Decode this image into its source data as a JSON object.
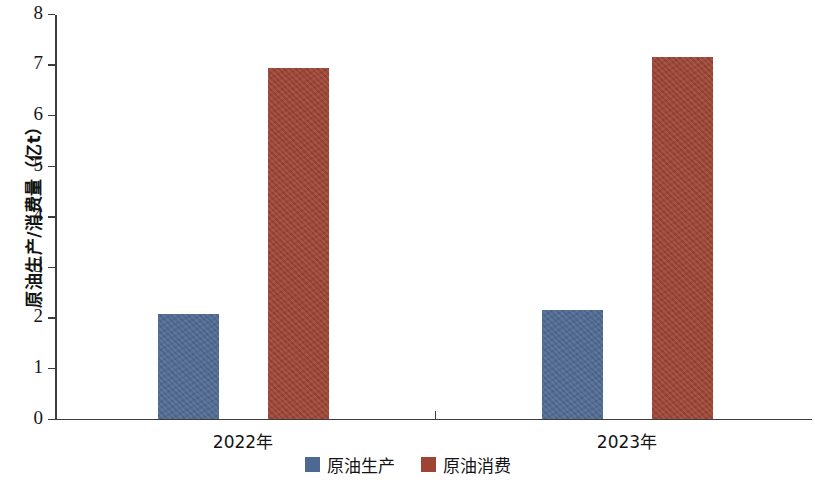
{
  "chart_data": {
    "type": "bar",
    "title": "",
    "xlabel": "",
    "ylabel": "原油生产/消费量（亿t）",
    "categories": [
      "2022年",
      "2023年"
    ],
    "series": [
      {
        "name": "原油生产",
        "color": "#4e6991",
        "values": [
          2.07,
          2.14
        ]
      },
      {
        "name": "原油消费",
        "color": "#9d4434",
        "values": [
          6.93,
          7.15
        ]
      }
    ],
    "ylim": [
      0,
      8
    ],
    "ytick_labels": [
      "0",
      "1",
      "2",
      "3",
      "4",
      "5",
      "6",
      "7",
      "8"
    ],
    "ytick_values": [
      0,
      1,
      2,
      3,
      4,
      5,
      6,
      7,
      8
    ],
    "grid": false,
    "legend_position": "bottom-center",
    "unit": "亿t"
  },
  "axis": {
    "y_title": "原油生产/消费量（亿t）",
    "ticks": [
      {
        "label": "8",
        "value": 8
      },
      {
        "label": "7",
        "value": 7
      },
      {
        "label": "6",
        "value": 6
      },
      {
        "label": "5",
        "value": 5
      },
      {
        "label": "4",
        "value": 4
      },
      {
        "label": "3",
        "value": 3
      },
      {
        "label": "2",
        "value": 2
      },
      {
        "label": "1",
        "value": 1
      },
      {
        "label": "0",
        "value": 0
      }
    ]
  },
  "categories": [
    {
      "label": "2022年"
    },
    {
      "label": "2023年"
    }
  ],
  "legend": {
    "items": [
      {
        "label": "原油生产",
        "color": "#4e6991"
      },
      {
        "label": "原油消费",
        "color": "#9d4434"
      }
    ]
  }
}
